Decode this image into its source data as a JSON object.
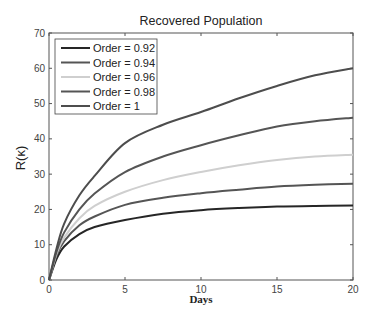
{
  "chart_data": {
    "type": "line",
    "title": "Recovered Population",
    "xlabel": "Days",
    "ylabel": "R(κ)",
    "xlim": [
      0,
      20
    ],
    "ylim": [
      0,
      70
    ],
    "xticks": [
      0,
      5,
      10,
      15,
      20
    ],
    "yticks": [
      0,
      10,
      20,
      30,
      40,
      50,
      60,
      70
    ],
    "grid": false,
    "legend_position": "top-left",
    "x": [
      0,
      0.5,
      1,
      2,
      3,
      5,
      7.5,
      10,
      12.5,
      15,
      17.5,
      20
    ],
    "series": [
      {
        "name": "Order = 0.92",
        "color": "#262626",
        "values": [
          0,
          6,
          9.5,
          13,
          15,
          17,
          18.8,
          19.8,
          20.4,
          20.8,
          21,
          21.1
        ]
      },
      {
        "name": "Order = 0.94",
        "color": "#555555",
        "values": [
          0,
          7,
          11,
          15.5,
          18,
          21.3,
          23.3,
          24.6,
          25.6,
          26.5,
          27,
          27.3
        ]
      },
      {
        "name": "Order = 0.96",
        "color": "#cfcfcf",
        "values": [
          0,
          7.5,
          12,
          17.5,
          21,
          25,
          28.3,
          30.6,
          32.5,
          34,
          35,
          35.5
        ]
      },
      {
        "name": "Order = 0.98",
        "color": "#555555",
        "values": [
          0,
          8,
          13.5,
          20,
          24.5,
          30.6,
          35,
          38.2,
          41,
          43.5,
          45,
          46
        ]
      },
      {
        "name": "Order = 1",
        "color": "#4d4d4d",
        "values": [
          0,
          9,
          16,
          24,
          29.5,
          38.8,
          44,
          47.6,
          51.5,
          55,
          58,
          60
        ]
      }
    ]
  }
}
